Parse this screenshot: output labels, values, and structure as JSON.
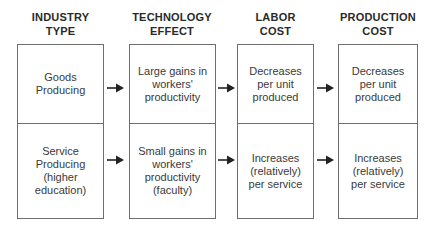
{
  "columns": [
    {
      "header": "INDUSTRY TYPE",
      "header_lines": [
        "INDUSTRY",
        "TYPE"
      ],
      "rows": [
        "Goods Producing",
        "Service Producing (higher education)"
      ]
    },
    {
      "header": "TECHNOLOGY EFFECT",
      "header_lines": [
        "TECHNOLOGY",
        "EFFECT"
      ],
      "rows": [
        "Large gains in workers' productivity",
        "Small gains in workers' productivity (faculty)"
      ]
    },
    {
      "header": "LABOR COST",
      "header_lines": [
        "LABOR",
        "COST"
      ],
      "rows": [
        "Decreases per unit produced",
        "Increases (relatively) per service"
      ]
    },
    {
      "header": "PRODUCTION COST",
      "header_lines": [
        "PRODUCTION",
        "COST"
      ],
      "rows": [
        "Decreases per unit produced",
        "Increases (relatively) per service"
      ]
    }
  ],
  "arrows": {
    "icon": "arrow-right-icon",
    "color": "#222222"
  }
}
